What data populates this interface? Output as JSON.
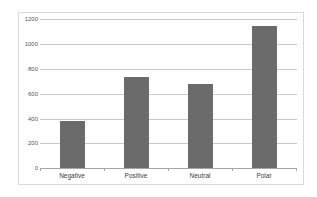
{
  "chart_data": {
    "type": "bar",
    "title": "",
    "xlabel": "",
    "ylabel": "",
    "categories": [
      "Negative",
      "Positive",
      "Neutral",
      "Polar"
    ],
    "values": [
      375,
      730,
      680,
      1140
    ],
    "ylim": [
      0,
      1200
    ],
    "yticks": [
      0,
      200,
      400,
      600,
      800,
      1000,
      1200
    ],
    "grid": true,
    "legend": null,
    "bar_color": "#6b6b6b"
  },
  "labels": {
    "yticks": [
      "0",
      "200",
      "400",
      "600",
      "800",
      "1000",
      "1200"
    ],
    "categories": [
      "Negative",
      "Positive",
      "Neutral",
      "Polar"
    ]
  }
}
